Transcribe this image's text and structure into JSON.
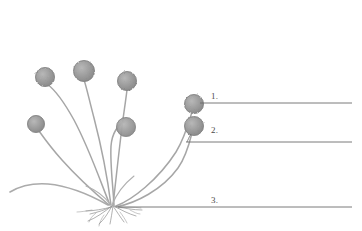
{
  "diagram": {
    "background_color": "#ffffff",
    "ink_color": "#8e8e8e",
    "sporangium_fill": "#9a9a9a",
    "sporangium_stroke": "#7d7d7d",
    "stalk_color": "#a3a3a3",
    "rhizoid_color": "#8a8a8a",
    "leader_line_color": "#6b6b6b",
    "label_text_color": "#4a4a4a"
  },
  "labels": [
    {
      "id": "label-1",
      "number": "1.",
      "line_y": 103,
      "line_x_start": 196,
      "line_x_end": 352
    },
    {
      "id": "label-2",
      "number": "2.",
      "line_y": 142,
      "line_x_start": 186,
      "line_x_end": 352
    },
    {
      "id": "label-3",
      "number": "3.",
      "line_y": 207,
      "line_x_start": 118,
      "line_x_end": 352
    }
  ],
  "sporangia": [
    {
      "id": "sporangium-a",
      "cx": 45,
      "cy": 77,
      "r": 9.5
    },
    {
      "id": "sporangium-b",
      "cx": 84,
      "cy": 71,
      "r": 10.5
    },
    {
      "id": "sporangium-c",
      "cx": 36,
      "cy": 124,
      "r": 8.5
    },
    {
      "id": "sporangium-d",
      "cx": 127,
      "cy": 81,
      "r": 9.5
    },
    {
      "id": "sporangium-e",
      "cx": 126,
      "cy": 127,
      "r": 9.5
    },
    {
      "id": "sporangium-f",
      "cx": 194,
      "cy": 104,
      "r": 9.5
    },
    {
      "id": "sporangium-g",
      "cx": 194,
      "cy": 126,
      "r": 9.5
    }
  ]
}
